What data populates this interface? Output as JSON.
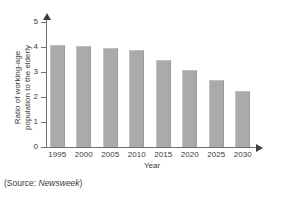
{
  "chart_data": {
    "type": "bar",
    "title": "",
    "xlabel": "Year",
    "ylabel_line1": "Ratio of working-age",
    "ylabel_line2": "population to the elderly",
    "categories": [
      "1995",
      "2000",
      "2005",
      "2010",
      "2015",
      "2020",
      "2025",
      "2030"
    ],
    "values": [
      4.1,
      4.05,
      3.95,
      3.9,
      3.5,
      3.1,
      2.7,
      2.25
    ],
    "ylim": [
      0,
      5
    ],
    "yticks": [
      "0",
      "1",
      "2",
      "3",
      "4",
      "5"
    ],
    "grid": false,
    "legend": false,
    "bar_color": "#aaaaaa",
    "axis_color": "#6f6f6f"
  },
  "source": {
    "prefix": "(Source: ",
    "publication": "Newsweek",
    "suffix": ")"
  }
}
